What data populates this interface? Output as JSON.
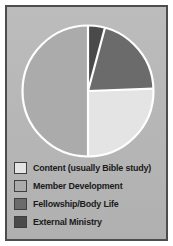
{
  "figure": {
    "background_color": "#ffffff",
    "panel_color": "#b9b9b9",
    "border_color": "#4d4d4d",
    "divider_color": "#ffffff"
  },
  "chart_data": {
    "type": "pie",
    "title": "",
    "subtitle": "",
    "xlabel": "",
    "ylabel": "",
    "grid": false,
    "legend_position": "bottom",
    "start_angle_deg": 0,
    "direction": "clockwise",
    "categories": [
      "Content (usually Bible study)",
      "Member Development",
      "Fellowship/Body Life",
      "External Ministry"
    ],
    "values": [
      25.6,
      50.0,
      20.3,
      4.1
    ],
    "units": "percent",
    "colors": [
      "#e4e4e4",
      "#ababab",
      "#6b6b6b",
      "#4a4a4a"
    ],
    "slices": [
      {
        "label": "External Ministry",
        "value": 4.1,
        "color": "#4a4a4a",
        "start_angle_deg": 0,
        "end_angle_deg": 15
      },
      {
        "label": "Fellowship/Body Life",
        "value": 20.3,
        "color": "#6b6b6b",
        "start_angle_deg": 15,
        "end_angle_deg": 88
      },
      {
        "label": "Content (usually Bible study)",
        "value": 25.6,
        "color": "#e4e4e4",
        "start_angle_deg": 88,
        "end_angle_deg": 180
      },
      {
        "label": "Member Development",
        "value": 50.0,
        "color": "#ababab",
        "start_angle_deg": 180,
        "end_angle_deg": 360
      }
    ]
  },
  "legend": {
    "items": [
      {
        "label": "Content (usually Bible study)",
        "color": "#e4e4e4"
      },
      {
        "label": "Member Development",
        "color": "#ababab"
      },
      {
        "label": "Fellowship/Body Life",
        "color": "#6b6b6b"
      },
      {
        "label": "External Ministry",
        "color": "#4a4a4a"
      }
    ]
  }
}
